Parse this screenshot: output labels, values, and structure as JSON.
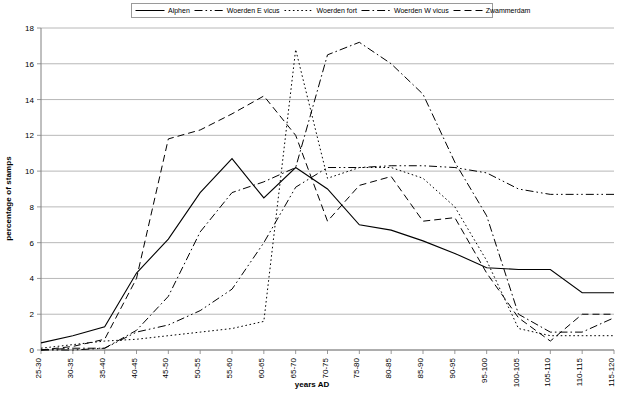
{
  "chart_data": {
    "type": "line",
    "title": "",
    "xlabel": "years AD",
    "ylabel": "percentage of stamps",
    "ylim": [
      0,
      18
    ],
    "yticks": [
      0,
      2,
      4,
      6,
      8,
      10,
      12,
      14,
      16,
      18
    ],
    "grid": "horizontal",
    "legend_position": "top",
    "categories": [
      "25-30",
      "30-35",
      "35-40",
      "40-45",
      "45-50",
      "50-55",
      "55-60",
      "60-65",
      "65-70",
      "70-75",
      "75-80",
      "80-85",
      "85-90",
      "90-95",
      "95-100",
      "100-105",
      "105-110",
      "110-115",
      "115-120"
    ],
    "series": [
      {
        "name": "Alphen",
        "style": "solid",
        "values": [
          0.4,
          0.8,
          1.3,
          4.3,
          6.2,
          8.8,
          10.7,
          8.5,
          10.2,
          9.0,
          7.0,
          6.7,
          6.1,
          5.4,
          4.6,
          4.5,
          4.5,
          3.2,
          3.2
        ]
      },
      {
        "name": "Woerden E vicus",
        "style": "dash-dot-dot",
        "values": [
          0.0,
          0.0,
          0.1,
          1.0,
          1.4,
          2.2,
          3.4,
          6.0,
          9.1,
          10.2,
          10.2,
          10.3,
          10.3,
          10.2,
          9.9,
          9.0,
          8.7,
          8.7,
          8.7
        ]
      },
      {
        "name": "Woerden fort",
        "style": "dotted",
        "values": [
          0.1,
          0.3,
          0.5,
          0.6,
          0.8,
          1.0,
          1.2,
          1.6,
          16.8,
          9.6,
          10.2,
          10.2,
          9.6,
          8.0,
          5.0,
          1.2,
          0.8,
          0.8,
          0.8
        ]
      },
      {
        "name": "Woerden W vicus",
        "style": "dash-dot",
        "values": [
          0.0,
          0.1,
          0.1,
          1.1,
          3.0,
          6.6,
          8.8,
          9.4,
          10.2,
          16.5,
          17.2,
          16.0,
          14.3,
          10.5,
          7.5,
          2.0,
          1.0,
          1.0,
          1.8
        ]
      },
      {
        "name": "Zwammerdam",
        "style": "dashed",
        "values": [
          0.0,
          0.2,
          0.6,
          4.0,
          11.8,
          12.3,
          13.2,
          14.2,
          12.0,
          7.2,
          9.2,
          9.7,
          7.2,
          7.4,
          4.3,
          1.8,
          0.5,
          2.0,
          2.0
        ]
      }
    ]
  },
  "legend": {
    "entries": [
      {
        "label": "Alphen",
        "style": "solid"
      },
      {
        "label": "Woerden E vicus",
        "style": "dash-dot-dot"
      },
      {
        "label": "Woerden fort",
        "style": "dotted"
      },
      {
        "label": "Woerden W vicus",
        "style": "dash-dot"
      },
      {
        "label": "Zwammerdam",
        "style": "dashed"
      }
    ]
  },
  "axes": {
    "x_title": "years AD",
    "y_title": "percentage of stamps"
  },
  "colors": {
    "line": "#000000",
    "grid": "#a6a6a6",
    "axis": "#808080",
    "background": "#ffffff"
  }
}
